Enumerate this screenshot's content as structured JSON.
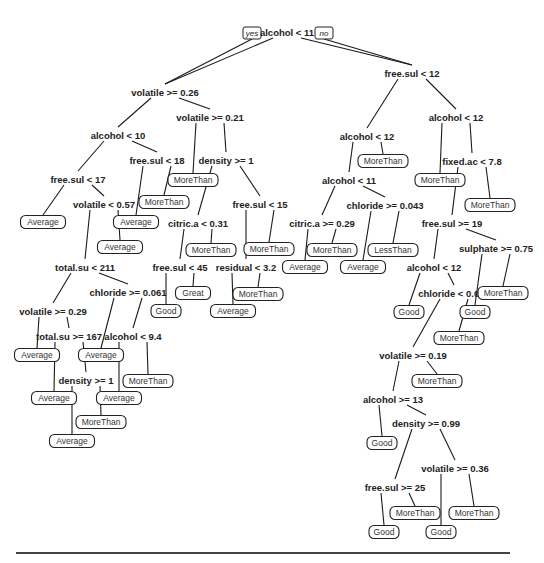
{
  "diagram": {
    "type": "decision-tree",
    "root_branch_labels": {
      "yes": "yes",
      "no": "no"
    },
    "splits": [
      {
        "id": "s1",
        "label": "alcohol < 11",
        "x": 287,
        "y": 33
      },
      {
        "id": "s2",
        "label": "volatile >= 0.26",
        "x": 165,
        "y": 93
      },
      {
        "id": "s3",
        "label": "free.sul < 12",
        "x": 412,
        "y": 74
      },
      {
        "id": "s4",
        "label": "volatile >= 0.21",
        "x": 210,
        "y": 118
      },
      {
        "id": "s5",
        "label": "alcohol < 10",
        "x": 118,
        "y": 136
      },
      {
        "id": "s6",
        "label": "free.sul < 18",
        "x": 157,
        "y": 161
      },
      {
        "id": "s7",
        "label": "free.sul < 17",
        "x": 78,
        "y": 180
      },
      {
        "id": "s8",
        "label": "volatile < 0.57",
        "x": 104,
        "y": 205
      },
      {
        "id": "s9",
        "label": "density >= 1",
        "x": 226,
        "y": 161
      },
      {
        "id": "s10",
        "label": "citric.a < 0.31",
        "x": 198,
        "y": 224
      },
      {
        "id": "s11",
        "label": "free.sul < 15",
        "x": 260,
        "y": 205
      },
      {
        "id": "s12",
        "label": "free.sul < 45",
        "x": 180,
        "y": 268
      },
      {
        "id": "s13",
        "label": "residual < 3.2",
        "x": 246,
        "y": 268
      },
      {
        "id": "s14",
        "label": "total.su < 211",
        "x": 85,
        "y": 268
      },
      {
        "id": "s15",
        "label": "chloride >= 0.061",
        "x": 128,
        "y": 293
      },
      {
        "id": "s16",
        "label": "volatile >= 0.29",
        "x": 53,
        "y": 312
      },
      {
        "id": "s17",
        "label": "total.su >= 167",
        "x": 69,
        "y": 337
      },
      {
        "id": "s18",
        "label": "alcohol < 9.4",
        "x": 133,
        "y": 337
      },
      {
        "id": "s19",
        "label": "density >= 1",
        "x": 86,
        "y": 381
      },
      {
        "id": "s20",
        "label": "alcohol < 12",
        "x": 367,
        "y": 137
      },
      {
        "id": "s21",
        "label": "alcohol < 11",
        "x": 349,
        "y": 181
      },
      {
        "id": "s22",
        "label": "chloride >= 0.043",
        "x": 385,
        "y": 206
      },
      {
        "id": "s23",
        "label": "citric.a >= 0.29",
        "x": 322,
        "y": 224
      },
      {
        "id": "s24",
        "label": "alcohol < 12",
        "x": 456,
        "y": 118
      },
      {
        "id": "s25",
        "label": "fixed.ac < 7.8",
        "x": 472,
        "y": 162
      },
      {
        "id": "s26",
        "label": "free.sul >= 19",
        "x": 452,
        "y": 224
      },
      {
        "id": "s27",
        "label": "sulphate >= 0.75",
        "x": 496,
        "y": 249
      },
      {
        "id": "s28",
        "label": "alcohol < 12",
        "x": 434,
        "y": 268
      },
      {
        "id": "s29",
        "label": "chloride < 0.047",
        "x": 454,
        "y": 294
      },
      {
        "id": "s30",
        "label": "volatile >= 0.19",
        "x": 413,
        "y": 356
      },
      {
        "id": "s31",
        "label": "alcohol >= 13",
        "x": 393,
        "y": 400
      },
      {
        "id": "s32",
        "label": "density >= 0.99",
        "x": 426,
        "y": 424
      },
      {
        "id": "s33",
        "label": "volatile >= 0.36",
        "x": 455,
        "y": 469
      },
      {
        "id": "s34",
        "label": "free.sul >= 25",
        "x": 395,
        "y": 488
      }
    ],
    "leaves": [
      {
        "id": "l1",
        "label": "Average",
        "x": 43,
        "y": 222
      },
      {
        "id": "l2",
        "label": "Average",
        "x": 120,
        "y": 247
      },
      {
        "id": "l3",
        "label": "Average",
        "x": 136,
        "y": 222
      },
      {
        "id": "l4",
        "label": "MoreThan",
        "x": 164,
        "y": 202
      },
      {
        "id": "l5",
        "label": "MoreThan",
        "x": 193,
        "y": 180
      },
      {
        "id": "l6",
        "label": "MoreThan",
        "x": 211,
        "y": 250
      },
      {
        "id": "l7",
        "label": "Great",
        "x": 193,
        "y": 293
      },
      {
        "id": "l8",
        "label": "Good",
        "x": 166,
        "y": 311
      },
      {
        "id": "l9",
        "label": "MoreThan",
        "x": 269,
        "y": 249
      },
      {
        "id": "l10",
        "label": "MoreThan",
        "x": 258,
        "y": 294
      },
      {
        "id": "l11",
        "label": "Average",
        "x": 233,
        "y": 311
      },
      {
        "id": "l12",
        "label": "Average",
        "x": 37,
        "y": 355
      },
      {
        "id": "l13",
        "label": "Average",
        "x": 101,
        "y": 355
      },
      {
        "id": "l14",
        "label": "MoreThan",
        "x": 148,
        "y": 381
      },
      {
        "id": "l15",
        "label": "Average",
        "x": 119,
        "y": 398
      },
      {
        "id": "l16",
        "label": "Average",
        "x": 54,
        "y": 398
      },
      {
        "id": "l17",
        "label": "MoreThan",
        "x": 101,
        "y": 422
      },
      {
        "id": "l18",
        "label": "Average",
        "x": 72,
        "y": 441
      },
      {
        "id": "l19",
        "label": "MoreThan",
        "x": 383,
        "y": 161
      },
      {
        "id": "l20",
        "label": "MoreThan",
        "x": 332,
        "y": 250
      },
      {
        "id": "l21",
        "label": "Average",
        "x": 305,
        "y": 267
      },
      {
        "id": "l22",
        "label": "LessThan",
        "x": 393,
        "y": 250
      },
      {
        "id": "l23",
        "label": "Average",
        "x": 363,
        "y": 267
      },
      {
        "id": "l24",
        "label": "MoreThan",
        "x": 440,
        "y": 180
      },
      {
        "id": "l25",
        "label": "MoreThan",
        "x": 490,
        "y": 205
      },
      {
        "id": "l26",
        "label": "Good",
        "x": 409,
        "y": 312
      },
      {
        "id": "l27",
        "label": "MoreThan",
        "x": 503,
        "y": 293
      },
      {
        "id": "l28",
        "label": "Good",
        "x": 475,
        "y": 312
      },
      {
        "id": "l29",
        "label": "MoreThan",
        "x": 459,
        "y": 338
      },
      {
        "id": "l30",
        "label": "MoreThan",
        "x": 437,
        "y": 381
      },
      {
        "id": "l31",
        "label": "Good",
        "x": 382,
        "y": 443
      },
      {
        "id": "l32",
        "label": "MoreThan",
        "x": 415,
        "y": 513
      },
      {
        "id": "l33",
        "label": "Good",
        "x": 384,
        "y": 532
      },
      {
        "id": "l34",
        "label": "MoreThan",
        "x": 474,
        "y": 513
      },
      {
        "id": "l35",
        "label": "Good",
        "x": 441,
        "y": 532
      }
    ],
    "edges": [
      [
        "s1",
        "s2"
      ],
      [
        "s1",
        "s3"
      ],
      [
        "s2",
        "s5"
      ],
      [
        "s2",
        "s4"
      ],
      [
        "s5",
        "s7"
      ],
      [
        "s5",
        "s6"
      ],
      [
        "s7",
        "l1"
      ],
      [
        "s7",
        "s8"
      ],
      [
        "s8",
        "s14"
      ],
      [
        "s8",
        "l2"
      ],
      [
        "s6",
        "l3"
      ],
      [
        "s6",
        "l4"
      ],
      [
        "s4",
        "l5"
      ],
      [
        "s4",
        "s9"
      ],
      [
        "s9",
        "s10"
      ],
      [
        "s9",
        "s11"
      ],
      [
        "s10",
        "s12"
      ],
      [
        "s10",
        "l6"
      ],
      [
        "s12",
        "l8"
      ],
      [
        "s12",
        "l7"
      ],
      [
        "s11",
        "s13"
      ],
      [
        "s11",
        "l9"
      ],
      [
        "s13",
        "l11"
      ],
      [
        "s13",
        "l10"
      ],
      [
        "s14",
        "s16"
      ],
      [
        "s14",
        "s15"
      ],
      [
        "s16",
        "l12"
      ],
      [
        "s16",
        "s17"
      ],
      [
        "s17",
        "l16"
      ],
      [
        "s17",
        "s19"
      ],
      [
        "s19",
        "l18"
      ],
      [
        "s19",
        "l17"
      ],
      [
        "s15",
        "l13"
      ],
      [
        "s15",
        "s18"
      ],
      [
        "s18",
        "l15"
      ],
      [
        "s18",
        "l14"
      ],
      [
        "s3",
        "s20"
      ],
      [
        "s3",
        "s24"
      ],
      [
        "s20",
        "s21"
      ],
      [
        "s20",
        "l19"
      ],
      [
        "s21",
        "s23"
      ],
      [
        "s21",
        "s22"
      ],
      [
        "s23",
        "l21"
      ],
      [
        "s23",
        "l20"
      ],
      [
        "s22",
        "l23"
      ],
      [
        "s22",
        "l22"
      ],
      [
        "s24",
        "l24"
      ],
      [
        "s24",
        "s25"
      ],
      [
        "s25",
        "s26"
      ],
      [
        "s25",
        "l25"
      ],
      [
        "s26",
        "s28"
      ],
      [
        "s26",
        "s27"
      ],
      [
        "s27",
        "l28"
      ],
      [
        "s27",
        "l27"
      ],
      [
        "s28",
        "l26"
      ],
      [
        "s28",
        "s29"
      ],
      [
        "s29",
        "s30"
      ],
      [
        "s29",
        "l29"
      ],
      [
        "s30",
        "s31"
      ],
      [
        "s30",
        "l30"
      ],
      [
        "s31",
        "l31"
      ],
      [
        "s31",
        "s32"
      ],
      [
        "s32",
        "s34"
      ],
      [
        "s32",
        "s33"
      ],
      [
        "s34",
        "l33"
      ],
      [
        "s34",
        "l32"
      ],
      [
        "s33",
        "l35"
      ],
      [
        "s33",
        "l34"
      ]
    ]
  }
}
